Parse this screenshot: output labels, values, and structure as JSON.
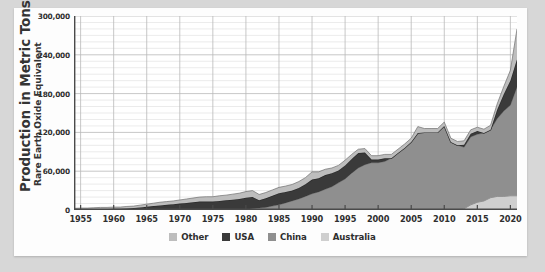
{
  "axis": {
    "y_title_main": "Production in Metric Tons",
    "y_title_sub": "Rare Earth Oxide Equivalent"
  },
  "colors": {
    "background": "#d7d7d7",
    "card": "#fdfdfd",
    "plot_background": "#ffffff",
    "gridline_major": "#b9b9b9",
    "gridline_minor": "#dedede",
    "axis_line": "#4a4a4a",
    "other": "#bdbdbd",
    "usa": "#3a3a3a",
    "china": "#8f8f8f",
    "australia": "#cfcfcf",
    "text": "#2f2f2f"
  },
  "legend": {
    "items": [
      {
        "label": "Other",
        "color": "#bdbdbd"
      },
      {
        "label": "USA",
        "color": "#3a3a3a"
      },
      {
        "label": "China",
        "color": "#8f8f8f"
      },
      {
        "label": "Australia",
        "color": "#cfcfcf"
      }
    ]
  },
  "chart_data": {
    "type": "area",
    "stacked": true,
    "title": "",
    "xlabel": "",
    "ylabel": "Production in Metric Tons — Rare Earth Oxide Equivalent",
    "xlim": [
      1954,
      2021
    ],
    "ylim": [
      0,
      300000
    ],
    "ytick_values": [
      0,
      60000,
      120000,
      180000,
      240000,
      300000
    ],
    "ytick_labels": [
      "0",
      "60,000",
      "120,000",
      "180,000",
      "240,000",
      "300,000"
    ],
    "yminor_step": 10000,
    "xtick_values": [
      1955,
      1960,
      1965,
      1970,
      1975,
      1980,
      1985,
      1990,
      1995,
      2000,
      2005,
      2010,
      2015,
      2020
    ],
    "xtick_labels": [
      "1955",
      "1960",
      "1965",
      "1970",
      "1975",
      "1980",
      "1985",
      "1990",
      "1995",
      "2000",
      "2005",
      "2010",
      "2015",
      "2020"
    ],
    "grid": true,
    "legend_position": "bottom",
    "x": [
      1954,
      1955,
      1956,
      1957,
      1958,
      1959,
      1960,
      1961,
      1962,
      1963,
      1964,
      1965,
      1966,
      1967,
      1968,
      1969,
      1970,
      1971,
      1972,
      1973,
      1974,
      1975,
      1976,
      1977,
      1978,
      1979,
      1980,
      1981,
      1982,
      1983,
      1984,
      1985,
      1986,
      1987,
      1988,
      1989,
      1990,
      1991,
      1992,
      1993,
      1994,
      1995,
      1996,
      1997,
      1998,
      1999,
      2000,
      2001,
      2002,
      2003,
      2004,
      2005,
      2006,
      2007,
      2008,
      2009,
      2010,
      2011,
      2012,
      2013,
      2014,
      2015,
      2016,
      2017,
      2018,
      2019,
      2020,
      2021
    ],
    "series": [
      {
        "name": "Australia",
        "color": "#cfcfcf",
        "values": [
          0,
          0,
          0,
          0,
          0,
          0,
          0,
          0,
          0,
          0,
          0,
          0,
          0,
          0,
          0,
          0,
          0,
          0,
          0,
          0,
          0,
          0,
          0,
          0,
          0,
          0,
          0,
          0,
          0,
          0,
          0,
          0,
          0,
          0,
          0,
          0,
          0,
          0,
          0,
          0,
          0,
          0,
          0,
          0,
          0,
          0,
          0,
          0,
          0,
          0,
          0,
          0,
          0,
          0,
          0,
          0,
          0,
          0,
          0,
          2000,
          8000,
          12000,
          14000,
          19000,
          21000,
          21000,
          22000,
          22000
        ]
      },
      {
        "name": "China",
        "color": "#8f8f8f",
        "values": [
          0,
          0,
          0,
          0,
          0,
          0,
          0,
          0,
          0,
          0,
          0,
          0,
          0,
          0,
          0,
          0,
          0,
          0,
          0,
          0,
          0,
          0,
          0,
          0,
          0,
          0,
          1000,
          2000,
          3000,
          4000,
          6000,
          8000,
          11000,
          14000,
          17000,
          21000,
          25000,
          28000,
          32000,
          36000,
          42000,
          48000,
          57000,
          65000,
          70000,
          73000,
          73000,
          75000,
          80000,
          88000,
          96000,
          105000,
          119000,
          120000,
          120000,
          120000,
          130000,
          105000,
          100000,
          95000,
          105000,
          105000,
          105000,
          105000,
          120000,
          132000,
          140000,
          168000
        ]
      },
      {
        "name": "USA",
        "color": "#3a3a3a",
        "values": [
          1000,
          1000,
          1000,
          1000,
          1500,
          1500,
          2000,
          2000,
          2500,
          3000,
          4000,
          5000,
          6000,
          7000,
          8000,
          9000,
          10000,
          11000,
          12000,
          13000,
          13000,
          13000,
          14000,
          15000,
          16000,
          17000,
          18000,
          18000,
          12000,
          14000,
          16000,
          18000,
          17000,
          16000,
          17000,
          19000,
          22000,
          21000,
          22000,
          21000,
          19000,
          21000,
          22000,
          23000,
          19000,
          5000,
          5000,
          5000,
          0,
          0,
          0,
          0,
          0,
          0,
          0,
          0,
          0,
          0,
          0,
          4000,
          5000,
          5000,
          0,
          0,
          14000,
          26000,
          38000,
          43000
        ]
      },
      {
        "name": "Other",
        "color": "#bdbdbd",
        "values": [
          1500,
          2000,
          2000,
          2500,
          2500,
          2500,
          2500,
          2500,
          3000,
          3000,
          3500,
          4000,
          4500,
          5000,
          5000,
          5000,
          5500,
          6000,
          6500,
          7000,
          7500,
          7500,
          8000,
          8000,
          8500,
          9000,
          9500,
          10000,
          9000,
          9000,
          9000,
          9000,
          9000,
          9500,
          10000,
          10000,
          12000,
          10000,
          9000,
          8000,
          8000,
          8000,
          7000,
          6000,
          6000,
          6000,
          6000,
          6000,
          6000,
          6000,
          6000,
          6000,
          10000,
          6000,
          6000,
          6000,
          6000,
          6000,
          6000,
          6000,
          6000,
          6000,
          6000,
          7000,
          9000,
          12000,
          16000,
          47000
        ]
      }
    ]
  }
}
